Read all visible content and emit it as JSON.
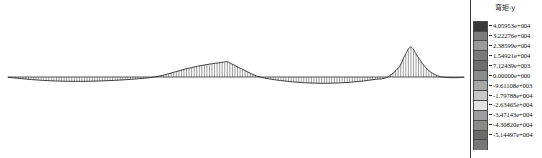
{
  "window": {
    "title": "弯矩-y"
  },
  "legend": {
    "title": "弯矩-y",
    "entries": [
      {
        "label": "4.05953e+004",
        "value": 40595.3,
        "color": "#3a3a3a"
      },
      {
        "label": "3.22276e+004",
        "value": 32227.6,
        "color": "#7d7d7d"
      },
      {
        "label": "2.38599e+004",
        "value": 23859.9,
        "color": "#9a9a9a"
      },
      {
        "label": "1.54921e+004",
        "value": 15492.1,
        "color": "#7a7a7a"
      },
      {
        "label": "7.12439e+003",
        "value": 7124.39,
        "color": "#6f6f6f"
      },
      {
        "label": "0.00000e+000",
        "value": 0.0,
        "color": "#8c8c8c"
      },
      {
        "label": "-9.61108e+003",
        "value": -9611.08,
        "color": "#a8a8a8"
      },
      {
        "label": "-1.79788e+004",
        "value": -17978.8,
        "color": "#c8c8c8"
      },
      {
        "label": "-2.63465e+004",
        "value": -26346.5,
        "color": "#e2e2e2"
      },
      {
        "label": "-3.47143e+004",
        "value": -34714.3,
        "color": "#9e9e9e"
      },
      {
        "label": "-4.30820e+004",
        "value": -43082.0,
        "color": "#8a8a8a"
      },
      {
        "label": "-5.14497e+004",
        "value": -51449.7,
        "color": "#6b6b6b"
      },
      {
        "label": "",
        "value": null,
        "color": "#787878"
      }
    ],
    "tick_labels": [
      "4.05953e+004",
      "3.22276e+004",
      "2.38599e+004",
      "1.54921e+004",
      "7.12439e+003",
      "0.00000e+000",
      "-9.61108e+003",
      "-1.79788e+004",
      "-2.63465e+004",
      "-3.47143e+004",
      "-4.30820e+004",
      "-5.14497e+004"
    ],
    "swatch_colors": [
      "#3a3a3a",
      "#7d7d7d",
      "#9a9a9a",
      "#7a7a7a",
      "#6f6f6f",
      "#8c8c8c",
      "#a8a8a8",
      "#c8c8c8",
      "#e2e2e2",
      "#9e9e9e",
      "#8a8a8a",
      "#6b6b6b",
      "#787878"
    ],
    "units": "",
    "min_label": "-5.14497e+004",
    "max_label": "4.05953e+004"
  },
  "chart_data": {
    "type": "line",
    "title": "弯矩-y",
    "subtitle": "",
    "xlabel": "",
    "ylabel": "",
    "grid": false,
    "legend_position": "right",
    "baseline": 0,
    "xlim": [
      0,
      462
    ],
    "ylim": [
      -51449.7,
      40595.3
    ],
    "series": [
      {
        "name": "弯矩-y",
        "x": [
          0,
          12,
          24,
          36,
          48,
          60,
          72,
          84,
          96,
          108,
          120,
          132,
          144,
          156,
          168,
          180,
          192,
          204,
          216,
          222,
          228,
          240,
          252,
          264,
          276,
          288,
          300,
          312,
          324,
          336,
          348,
          360,
          372,
          384,
          396,
          402,
          408,
          414,
          420,
          426,
          432,
          438,
          444,
          450,
          456,
          462
        ],
        "y": [
          -900,
          -4200,
          -7400,
          -9800,
          -11400,
          -12300,
          -12500,
          -12100,
          -11100,
          -9600,
          -7600,
          -5000,
          -1900,
          2000,
          6400,
          10800,
          14600,
          17400,
          19600,
          20600,
          16800,
          8800,
          1200,
          -5000,
          -10000,
          -13800,
          -16400,
          -17800,
          -18000,
          -17000,
          -14800,
          -11400,
          -6800,
          -1000,
          13000,
          29000,
          40595,
          30000,
          18000,
          9000,
          3600,
          400,
          -1400,
          -2000,
          -1800,
          -1100
        ]
      }
    ],
    "peaks": [
      {
        "label": "local max 1",
        "x": 222,
        "y": 20600
      },
      {
        "label": "global max",
        "x": 408,
        "y": 40595
      },
      {
        "label": "global min",
        "x": 324,
        "y": -18000
      }
    ]
  },
  "render": {
    "canvas_width": 542,
    "canvas_height": 158,
    "background": "#ffffff",
    "curve_color": "#2b2b2b",
    "hatch_color": "#4a4a4a",
    "baseline_color": "#2b2b2b"
  }
}
